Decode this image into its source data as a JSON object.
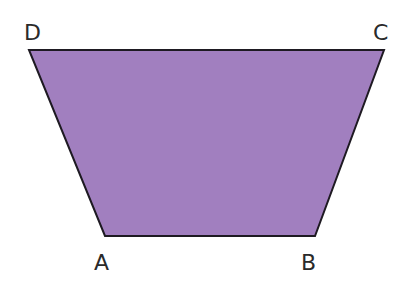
{
  "diagram": {
    "type": "trapezoid",
    "fill_color": "#a17fbf",
    "stroke_color": "#1e1a22",
    "vertices": {
      "A": {
        "label": "A",
        "x": 105,
        "y": 236
      },
      "B": {
        "label": "B",
        "x": 315,
        "y": 236
      },
      "C": {
        "label": "C",
        "x": 384,
        "y": 50
      },
      "D": {
        "label": "D",
        "x": 29,
        "y": 50
      }
    },
    "labels": [
      {
        "id": "D",
        "text": "D",
        "x": 24,
        "y": 40
      },
      {
        "id": "C",
        "text": "C",
        "x": 373,
        "y": 40
      },
      {
        "id": "A",
        "text": "A",
        "x": 94,
        "y": 270
      },
      {
        "id": "B",
        "text": "B",
        "x": 301,
        "y": 270
      }
    ]
  }
}
